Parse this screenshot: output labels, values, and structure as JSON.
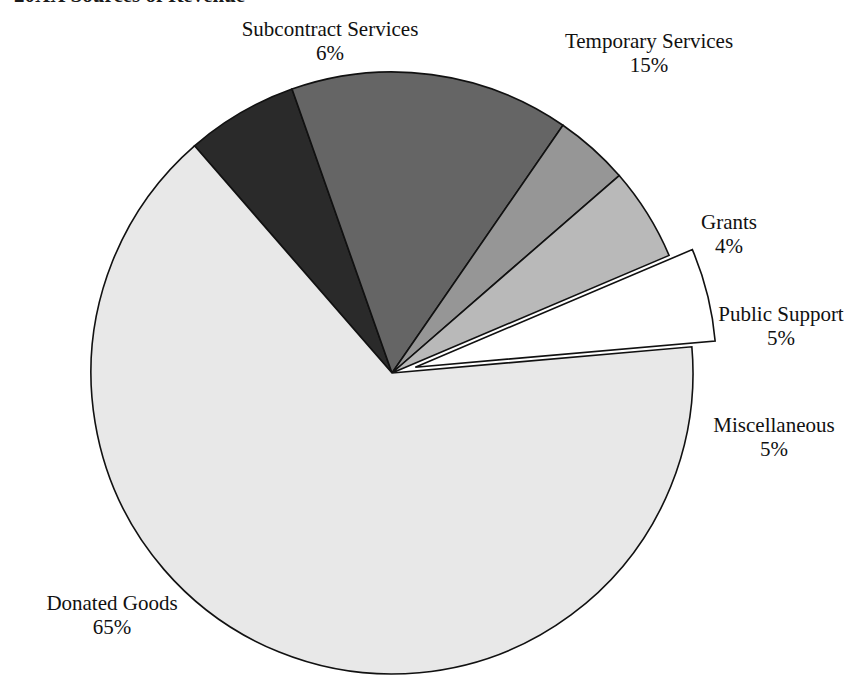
{
  "caption": {
    "text": "20XX Sources of Revenue"
  },
  "chart_data": {
    "type": "pie",
    "title": "20XX Sources of Revenue",
    "value_unit": "percent",
    "total": 100,
    "legend_position": "callout-labels",
    "grid": false,
    "categories": [
      "Subcontract Services",
      "Temporary Services",
      "Grants",
      "Public Support",
      "Miscellaneous",
      "Donated Goods"
    ],
    "values": [
      6,
      15,
      4,
      5,
      5,
      65
    ],
    "value_labels": [
      "6%",
      "15%",
      "4%",
      "5%",
      "5%",
      "65%"
    ],
    "colors": [
      "#2a2a2a",
      "#656565",
      "#969696",
      "#b9b9b9",
      "#ffffff",
      "#e8e8e8"
    ],
    "exploded": [
      false,
      false,
      false,
      false,
      true,
      false
    ],
    "slices": [
      {
        "label": "Subcontract Services",
        "value": 6,
        "value_label": "6%",
        "color": "#2a2a2a",
        "exploded": false
      },
      {
        "label": "Temporary Services",
        "value": 15,
        "value_label": "15%",
        "color": "#656565",
        "exploded": false
      },
      {
        "label": "Grants",
        "value": 4,
        "value_label": "4%",
        "color": "#969696",
        "exploded": false
      },
      {
        "label": "Public Support",
        "value": 5,
        "value_label": "5%",
        "color": "#b9b9b9",
        "exploded": false
      },
      {
        "label": "Miscellaneous",
        "value": 5,
        "value_label": "5%",
        "color": "#ffffff",
        "exploded": true
      },
      {
        "label": "Donated Goods",
        "value": 65,
        "value_label": "65%",
        "color": "#e8e8e8",
        "exploded": false
      }
    ]
  },
  "labels": {
    "subcontract": {
      "name": "Subcontract Services",
      "pct": "6%"
    },
    "temporary": {
      "name": "Temporary Services",
      "pct": "15%"
    },
    "grants": {
      "name": "Grants",
      "pct": "4%"
    },
    "public": {
      "name": "Public Support",
      "pct": "5%"
    },
    "misc": {
      "name": "Miscellaneous",
      "pct": "5%"
    },
    "donated": {
      "name": "Donated Goods",
      "pct": "65%"
    }
  }
}
